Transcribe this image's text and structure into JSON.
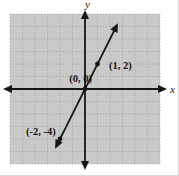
{
  "colors": {
    "page_background": "#ffffff",
    "plot_background": "#c9c9c9",
    "grid_dots": "#9c9c9c",
    "ink": "#161616"
  },
  "chart_data": {
    "type": "line",
    "title": "",
    "xlabel": "x",
    "ylabel": "y",
    "xlim": [
      -6,
      6
    ],
    "ylim": [
      -6,
      6
    ],
    "grid": true,
    "grid_step": 1,
    "tick_labels_shown": false,
    "axis_arrows_both_ends": true,
    "series": [
      {
        "name": "line through origin",
        "slope": 2,
        "intercept": 0,
        "points": [
          [
            -2,
            -4
          ],
          [
            0,
            0
          ],
          [
            1,
            2
          ]
        ],
        "point_labels": [
          "(-2, -4)",
          "(0, 0)",
          "(1, 2)"
        ],
        "line_extent_x": [
          -2.32,
          2.56
        ],
        "arrowheads": "both"
      }
    ]
  }
}
